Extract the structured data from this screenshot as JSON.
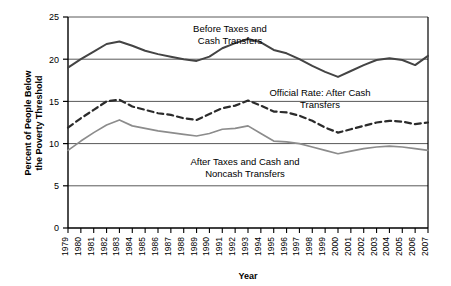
{
  "chart_data": {
    "type": "line",
    "title": "",
    "xlabel": "Year",
    "ylabel": "Percent of People Below the Poverty Threshold",
    "ylim": [
      0,
      25
    ],
    "yticks": [
      0,
      5,
      10,
      15,
      20,
      25
    ],
    "grid": "horizontal",
    "legend_position": "inline-annotations",
    "categories": [
      "1979",
      "1980",
      "1981",
      "1982",
      "1983",
      "1984",
      "1985",
      "1986",
      "1987",
      "1988",
      "1989",
      "1990",
      "1991",
      "1992",
      "1993",
      "1994",
      "1995",
      "1996",
      "1997",
      "1998",
      "1999",
      "2000",
      "2001",
      "2002",
      "2003",
      "2004",
      "2005",
      "2006",
      "2007"
    ],
    "series": [
      {
        "name": "Before Taxes and Cash Transfers",
        "style": "solid",
        "color": "#444444",
        "values": [
          19.0,
          20.0,
          20.9,
          21.8,
          22.1,
          21.6,
          21.0,
          20.6,
          20.3,
          20.0,
          19.8,
          20.3,
          21.3,
          21.9,
          22.4,
          22.0,
          21.1,
          20.7,
          20.0,
          19.2,
          18.5,
          17.9,
          18.6,
          19.3,
          19.9,
          20.1,
          19.9,
          19.3,
          20.4
        ]
      },
      {
        "name": "Official Rate: After Cash Transfers",
        "style": "dashed",
        "color": "#2b2b2b",
        "values": [
          11.9,
          13.0,
          14.0,
          15.0,
          15.2,
          14.4,
          14.0,
          13.6,
          13.4,
          13.0,
          12.8,
          13.5,
          14.2,
          14.5,
          15.1,
          14.5,
          13.8,
          13.7,
          13.3,
          12.7,
          11.9,
          11.3,
          11.7,
          12.1,
          12.5,
          12.7,
          12.6,
          12.3,
          12.5
        ]
      },
      {
        "name": "After Taxes and Cash and Noncash Transfers",
        "style": "solid-light",
        "color": "#8c8c8c",
        "values": [
          9.2,
          10.3,
          11.3,
          12.2,
          12.8,
          12.1,
          11.8,
          11.5,
          11.3,
          11.1,
          10.9,
          11.2,
          11.7,
          11.8,
          12.1,
          11.2,
          10.3,
          10.2,
          10.0,
          9.6,
          9.2,
          8.8,
          9.1,
          9.4,
          9.6,
          9.7,
          9.6,
          9.4,
          9.2
        ]
      }
    ],
    "annotations": [
      {
        "text_line1": "Before Taxes and",
        "text_line2": "Cash Transfers"
      },
      {
        "text_line1": "Official Rate: After Cash",
        "text_line2": "Transfers"
      },
      {
        "text_line1": "After Taxes and Cash and",
        "text_line2": "Noncash Transfers"
      }
    ]
  },
  "axis": {
    "y_label_line1": "Percent of People Below",
    "y_label_line2": "the Poverty Threshold",
    "x_label": "Year"
  }
}
